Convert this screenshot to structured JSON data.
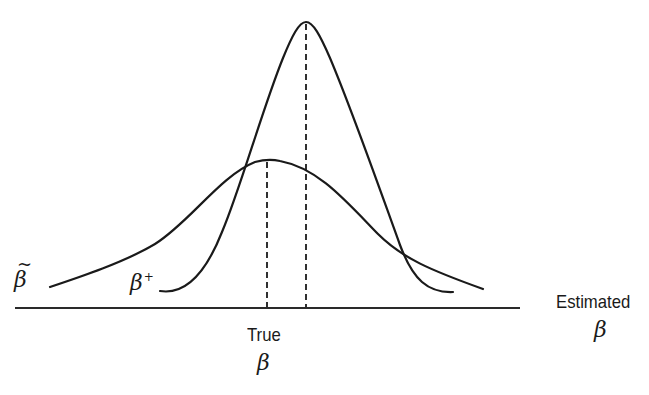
{
  "diagram": {
    "title": "",
    "axis": {
      "label_word": "Estimated",
      "label_symbol": "β",
      "x_start": 15,
      "x_end": 520,
      "y": 308
    },
    "true_value": {
      "label_word": "True",
      "label_symbol": "β",
      "x": 267
    },
    "curves": [
      {
        "name": "wide-distribution",
        "label_symbol": "β",
        "label_accent": "~",
        "label_text": "β̃",
        "description": "Unbiased estimator with larger variance, centered on the true β",
        "mean_x": 267,
        "peak_y": 160
      },
      {
        "name": "narrow-distribution",
        "label_symbol": "β",
        "label_superscript": "+",
        "label_text": "β⁺",
        "description": "Biased estimator with smaller variance, centered to the right of the true β",
        "mean_x": 306,
        "peak_y": 22
      }
    ],
    "dashed_lines": [
      {
        "x": 267,
        "from_y": 160,
        "to_y": 308,
        "meaning": "true β"
      },
      {
        "x": 306,
        "from_y": 22,
        "to_y": 308,
        "meaning": "mean of β⁺"
      }
    ],
    "colors": {
      "ink": "#1a1a1a",
      "background": "#ffffff"
    }
  }
}
